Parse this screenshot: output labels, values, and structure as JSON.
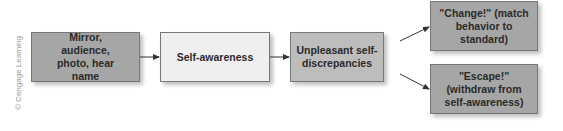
{
  "credit": "© Cengage Learning",
  "nodes": {
    "trigger": "Mirror, audience, photo, hear name",
    "awareness": "Self-awareness",
    "discrepancy": "Unpleasant self-discrepancies",
    "change": "\"Change!\" (match behavior to standard)",
    "escape": "\"Escape!\" (withdraw from self-awareness)"
  },
  "colors": {
    "dark": "#a6a6a6",
    "light": "#efefef",
    "mid": "#bdbdbd",
    "arrow": "#333333"
  }
}
